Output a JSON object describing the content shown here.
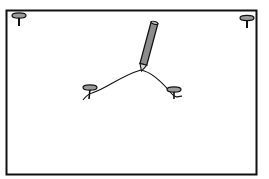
{
  "diagram": {
    "title": "",
    "elements": [
      {
        "id": "frame",
        "type": "rectangle",
        "label": ""
      },
      {
        "id": "corner-pin-top-left",
        "type": "pin",
        "label": ""
      },
      {
        "id": "corner-pin-top-right",
        "type": "pin",
        "label": ""
      },
      {
        "id": "focus-pin-left",
        "type": "pin",
        "label": ""
      },
      {
        "id": "focus-pin-right",
        "type": "pin",
        "label": ""
      },
      {
        "id": "pencil",
        "type": "pencil",
        "label": ""
      },
      {
        "id": "string",
        "type": "curve",
        "label": ""
      }
    ],
    "colors": {
      "stroke": "#111111",
      "pin_head": "#9a9a9a",
      "pencil_body": "#8c8c8c",
      "pencil_tip": "#d8d8d8",
      "background": "#ffffff"
    }
  }
}
